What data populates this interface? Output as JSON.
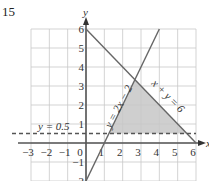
{
  "question_number": "15",
  "chart_data": {
    "type": "line",
    "title": "",
    "xlabel": "x",
    "ylabel": "y",
    "xlim": [
      -3,
      6
    ],
    "ylim": [
      -2,
      6
    ],
    "grid": true,
    "x_ticks": [
      "-3",
      "-2",
      "-1",
      "0",
      "1",
      "2",
      "3",
      "4",
      "5",
      "6"
    ],
    "y_ticks": [
      "-2",
      "-1",
      "1",
      "2",
      "3",
      "4",
      "5",
      "6"
    ],
    "lines": [
      {
        "name": "x + y = 6",
        "label": "x + y = 6",
        "style": "solid",
        "points": [
          [
            0,
            6
          ],
          [
            6,
            0
          ]
        ]
      },
      {
        "name": "y = 2x - 2",
        "label": "y = 2x − 2",
        "style": "solid",
        "points": [
          [
            0,
            -2
          ],
          [
            4,
            6
          ]
        ]
      },
      {
        "name": "y = 0.5",
        "label": "y = 0.5",
        "style": "dashed",
        "points": [
          [
            -3,
            0.5
          ],
          [
            6,
            0.5
          ]
        ]
      }
    ],
    "shaded_region": {
      "description": "feasible region bounded by y = 2x - 2, x + y = 6 and y = 0.5",
      "vertices": [
        [
          1.25,
          0.5
        ],
        [
          2.6667,
          3.3333
        ],
        [
          5.5,
          0.5
        ]
      ],
      "color": "#cfcfcf"
    }
  }
}
